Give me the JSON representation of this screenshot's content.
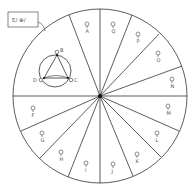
{
  "diagram": {
    "label_box": {
      "text": "E/ ⊕/"
    },
    "inset": {
      "nodes": [
        {
          "id": "B",
          "label": "B"
        },
        {
          "id": "C",
          "label": "C"
        },
        {
          "id": "D",
          "label": "D"
        }
      ]
    },
    "segments": [
      {
        "label": "A"
      },
      {
        "label": "Q"
      },
      {
        "label": "P"
      },
      {
        "label": "O"
      },
      {
        "label": "N"
      },
      {
        "label": "M"
      },
      {
        "label": "L"
      },
      {
        "label": "K"
      },
      {
        "label": "J"
      },
      {
        "label": "I"
      },
      {
        "label": "H"
      },
      {
        "label": "G"
      },
      {
        "label": "F"
      }
    ],
    "colors": {
      "stroke": "#333333",
      "text": "#555555",
      "background": "#ffffff"
    }
  }
}
